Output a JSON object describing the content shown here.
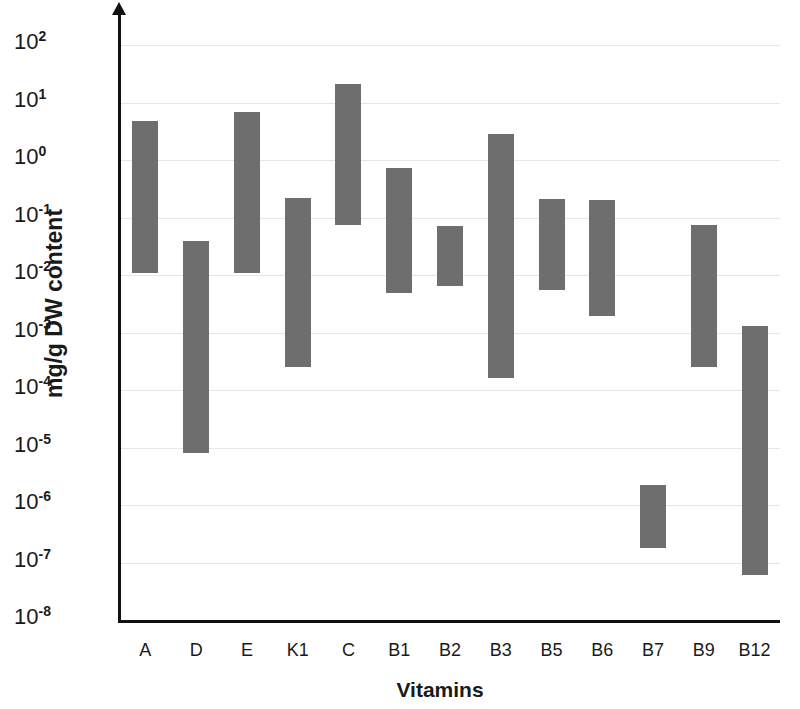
{
  "chart_data": {
    "type": "bar",
    "chart_style": "floating range bars (min-max)",
    "title": "",
    "xlabel": "Vitamins",
    "ylabel": "mg/g DW content",
    "yscale": "log10",
    "ylim": [
      1e-08,
      100
    ],
    "grid": true,
    "legend": null,
    "bar_color": "#6e6e6e",
    "categories": [
      "A",
      "D",
      "E",
      "K1",
      "C",
      "B1",
      "B2",
      "B3",
      "B5",
      "B6",
      "B7",
      "B9",
      "B12"
    ],
    "ytick_labels": [
      {
        "mantissa": "10",
        "exponent": "2",
        "value": 100
      },
      {
        "mantissa": "10",
        "exponent": "1",
        "value": 10
      },
      {
        "mantissa": "10",
        "exponent": "0",
        "value": 1
      },
      {
        "mantissa": "10",
        "exponent": "-1",
        "value": 0.1
      },
      {
        "mantissa": "10",
        "exponent": "-2",
        "value": 0.01
      },
      {
        "mantissa": "10",
        "exponent": "-3",
        "value": 0.001
      },
      {
        "mantissa": "10",
        "exponent": "-4",
        "value": 0.0001
      },
      {
        "mantissa": "10",
        "exponent": "-5",
        "value": 1e-05
      },
      {
        "mantissa": "10",
        "exponent": "-6",
        "value": 1e-06
      },
      {
        "mantissa": "10",
        "exponent": "-7",
        "value": 1e-07
      },
      {
        "mantissa": "10",
        "exponent": "-8",
        "value": 1e-08
      }
    ],
    "series": [
      {
        "name": "low",
        "values": [
          0.011,
          8e-06,
          0.011,
          0.00025,
          0.074,
          0.0049,
          0.0064,
          0.00016,
          0.0055,
          0.0019,
          1.8e-07,
          0.00025,
          6e-08
        ]
      },
      {
        "name": "high",
        "values": [
          4.8,
          0.039,
          6.8,
          0.22,
          21.0,
          0.72,
          0.071,
          2.8,
          0.21,
          0.2,
          2.2e-06,
          0.074,
          0.0013
        ]
      }
    ],
    "bars": [
      {
        "category": "A",
        "low": 0.011,
        "high": 4.8
      },
      {
        "category": "D",
        "low": 8e-06,
        "high": 0.039
      },
      {
        "category": "E",
        "low": 0.011,
        "high": 6.8
      },
      {
        "category": "K1",
        "low": 0.00025,
        "high": 0.22
      },
      {
        "category": "C",
        "low": 0.074,
        "high": 21.0
      },
      {
        "category": "B1",
        "low": 0.0049,
        "high": 0.72
      },
      {
        "category": "B2",
        "low": 0.0064,
        "high": 0.071
      },
      {
        "category": "B3",
        "low": 0.00016,
        "high": 2.8
      },
      {
        "category": "B5",
        "low": 0.0055,
        "high": 0.21
      },
      {
        "category": "B6",
        "low": 0.0019,
        "high": 0.2
      },
      {
        "category": "B7",
        "low": 1.8e-07,
        "high": 2.2e-06
      },
      {
        "category": "B9",
        "low": 0.00025,
        "high": 0.074
      },
      {
        "category": "B12",
        "low": 6e-08,
        "high": 0.0013
      }
    ]
  }
}
